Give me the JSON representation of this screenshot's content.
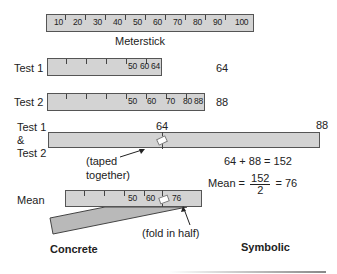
{
  "meterstick": {
    "label": "Meterstick",
    "ticks": [
      "10",
      "20",
      "30",
      "40",
      "50",
      "60",
      "70",
      "80",
      "90",
      "100"
    ]
  },
  "test1": {
    "label": "Test 1",
    "value": "64",
    "ticks": [
      "50",
      "60",
      "64"
    ]
  },
  "test2": {
    "label": "Test 2",
    "value": "88",
    "ticks": [
      "50",
      "60",
      "70",
      "80",
      "88"
    ]
  },
  "combined": {
    "label_line1": "Test 1",
    "label_line2": "&",
    "label_line3": "Test 2",
    "mark_left": "64",
    "mark_right": "88",
    "note_line1": "(taped",
    "note_line2": "together)",
    "sum_equation": "64 + 88 = 152"
  },
  "mean": {
    "label": "Mean",
    "ticks": [
      "50",
      "60",
      "76"
    ],
    "note": "(fold in half)",
    "eq_prefix": "Mean =",
    "numerator": "152",
    "denominator": "2",
    "eq_suffix": "= 76"
  },
  "columns": {
    "concrete": "Concrete",
    "symbolic": "Symbolic"
  }
}
